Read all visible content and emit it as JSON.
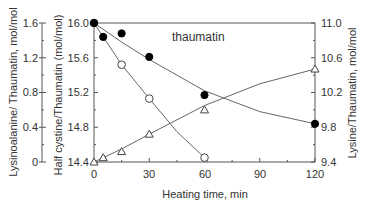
{
  "chart_data": {
    "type": "line",
    "title": "",
    "annotation": "thaumatin",
    "xlabel": "Heating time, min",
    "xlim": [
      0,
      120
    ],
    "x_ticks": [
      "0",
      "30",
      "60",
      "90",
      "120"
    ],
    "axes": {
      "left_outer": {
        "label": "Lysinoalanine/ Thaumatin, mol/mol",
        "ylim": [
          0,
          1.6
        ],
        "ticks": [
          "0",
          "0.4",
          "0.8",
          "1.2",
          "1.6"
        ]
      },
      "left_inner": {
        "label": "Half cystine/Thaumatin (mol/mol)",
        "ylim": [
          14.4,
          16.0
        ],
        "ticks": [
          "14.4",
          "14.8",
          "15.2",
          "15.6",
          "16.0"
        ]
      },
      "right": {
        "label": "Lysine/Thaumatin, mol/mol",
        "ylim": [
          9.4,
          11.0
        ],
        "ticks": [
          "9.4",
          "9.8",
          "10.2",
          "10.6",
          "11.0"
        ]
      }
    },
    "series": [
      {
        "name": "Half cystine",
        "marker": "open-circle",
        "axis": "left_inner",
        "x": [
          0,
          15,
          30,
          60
        ],
        "values": [
          16.0,
          15.52,
          15.13,
          14.45
        ]
      },
      {
        "name": "Lysine",
        "marker": "filled-circle",
        "axis": "right",
        "x": [
          0,
          5,
          15,
          30,
          60,
          120
        ],
        "values": [
          11.0,
          10.84,
          10.88,
          10.61,
          10.17,
          9.84
        ]
      },
      {
        "name": "Lysinoalanine",
        "marker": "open-triangle",
        "axis": "left_outer",
        "x": [
          0,
          5,
          15,
          30,
          60,
          120
        ],
        "values": [
          0.0,
          0.05,
          0.12,
          0.32,
          0.6,
          1.07
        ]
      }
    ],
    "grid": false,
    "legend": "none"
  }
}
